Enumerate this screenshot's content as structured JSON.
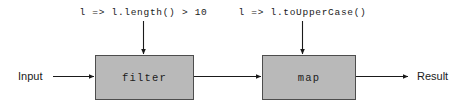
{
  "diagram": {
    "canvas": {
      "width": 464,
      "height": 107,
      "background": "#ffffff"
    },
    "style": {
      "box_fill": "#b9b9b9",
      "box_stroke": "#4d4d4d",
      "edge_color": "#1a1a1a",
      "text_color": "#1a1a1a"
    },
    "endpoints": {
      "input_label": "Input",
      "result_label": "Result"
    },
    "nodes": [
      {
        "id": "filter",
        "label": "filter",
        "x": 95,
        "y": 55,
        "width": 99,
        "height": 45
      },
      {
        "id": "map",
        "label": "map",
        "x": 262,
        "y": 55,
        "width": 94,
        "height": 45
      }
    ],
    "annotations": [
      {
        "id": "filter-lambda",
        "text": "l => l.length() > 10",
        "target": "filter",
        "center_x": 143,
        "y": 8
      },
      {
        "id": "map-lambda",
        "text": "l => l.toUpperCase()",
        "target": "map",
        "center_x": 302,
        "y": 8
      }
    ],
    "edges": [
      {
        "id": "input-to-filter",
        "from": "Input",
        "to": "filter",
        "direction": "horizontal"
      },
      {
        "id": "filter-to-map",
        "from": "filter",
        "to": "map",
        "direction": "horizontal"
      },
      {
        "id": "map-to-result",
        "from": "map",
        "to": "Result",
        "direction": "horizontal"
      },
      {
        "id": "lambda-to-filter",
        "from": "filter-lambda",
        "to": "filter",
        "direction": "vertical"
      },
      {
        "id": "lambda-to-map",
        "from": "map-lambda",
        "to": "map",
        "direction": "vertical"
      }
    ]
  }
}
